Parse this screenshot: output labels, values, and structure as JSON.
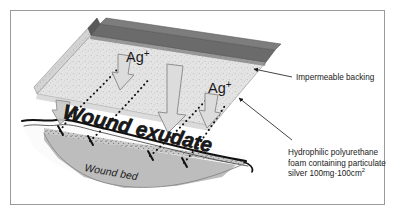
{
  "figure": {
    "frame_color": "#9a9a9a",
    "background_color": "#ffffff"
  },
  "colors": {
    "impermeable_backing": "#6b6b6b",
    "backing_top": "#777777",
    "backing_shadow": "#4f4f4f",
    "foam_face": "#e2e2e2",
    "foam_side": "#d2d2d2",
    "foam_outline": "#9d9d9d",
    "wound_bed_fill": "#b8b8b8",
    "skin_line": "#111111",
    "exudate_dotted": "#111111",
    "arrow_fill": "#d8d8d8",
    "arrow_outline": "#8a8a8a",
    "text": "#1a1a1a",
    "leader_line": "#3a3a3a"
  },
  "labels": {
    "ag_left": "Ag",
    "ag_left_charge": "+",
    "ag_right": "Ag",
    "ag_right_charge": "+",
    "wound_exudate": "Wound exudate",
    "wound_bed": "Wound bed",
    "impermeable_backing": "Impermeable backing",
    "foam_line_1": "Hydrophilic polyurethane",
    "foam_line_2": "foam containing particulate",
    "foam_line_3a": "silver 100mg·100cm",
    "foam_line_3b": "2"
  },
  "annotations": [
    {
      "id": "impermeable-backing",
      "text": "Impermeable backing",
      "points_to": "dark top layer of dressing"
    },
    {
      "id": "hydrophilic-foam",
      "text": "Hydrophilic polyurethane foam containing particulate silver 100mg·100cm2",
      "points_to": "light speckled foam body of dressing"
    }
  ],
  "flows": {
    "silver_release": "Ag+ ions move downward from foam into wound",
    "exudate_uptake": "Wound exudate drawn upward into foam"
  }
}
